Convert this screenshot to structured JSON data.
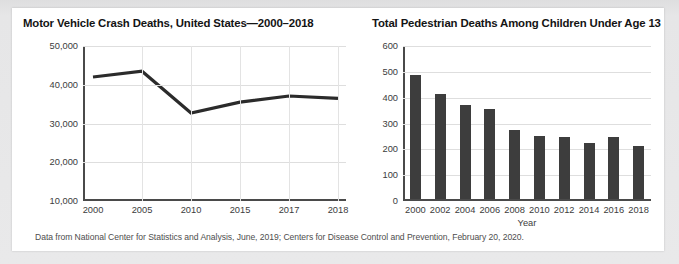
{
  "footer": {
    "source_note": "Data from National Center for Statistics and Analysis, June, 2019; Centers for Disease Control and Prevention, February 20, 2020."
  },
  "charts": [
    {
      "id": "motor-vehicle-crash-deaths",
      "title": "Motor Vehicle Crash Deaths, United States—2000–2018"
    },
    {
      "id": "pedestrian-deaths-children",
      "title": "Total Pedestrian Deaths Among Children Under Age 13"
    }
  ],
  "chart_data": [
    {
      "type": "line",
      "title": "Motor Vehicle Crash Deaths, United States—2000–2018",
      "xlabel": "",
      "ylabel": "",
      "categories": [
        "2000",
        "2005",
        "2010",
        "2015",
        "2017",
        "2018"
      ],
      "values": [
        42000,
        43500,
        32700,
        35500,
        37100,
        36500
      ],
      "ylim": [
        10000,
        50000
      ],
      "yticks": [
        "10,000",
        "20,000",
        "30,000",
        "40,000",
        "50,000"
      ],
      "ytick_values": [
        10000,
        20000,
        30000,
        40000,
        50000
      ],
      "grid": true,
      "legend": "none",
      "line_color": "#2b2b2b"
    },
    {
      "type": "bar",
      "title": "Total Pedestrian Deaths Among Children Under Age 13",
      "xlabel": "Year",
      "ylabel": "",
      "categories": [
        "2000",
        "2002",
        "2004",
        "2006",
        "2008",
        "2010",
        "2012",
        "2014",
        "2016",
        "2018"
      ],
      "values": [
        480,
        410,
        365,
        350,
        270,
        245,
        240,
        220,
        240,
        205
      ],
      "ylim": [
        0,
        600
      ],
      "yticks": [
        "0",
        "100",
        "200",
        "300",
        "400",
        "500",
        "600"
      ],
      "ytick_values": [
        0,
        100,
        200,
        300,
        400,
        500,
        600
      ],
      "grid": true,
      "legend": "none",
      "bar_color": "#3d3d3d"
    }
  ]
}
